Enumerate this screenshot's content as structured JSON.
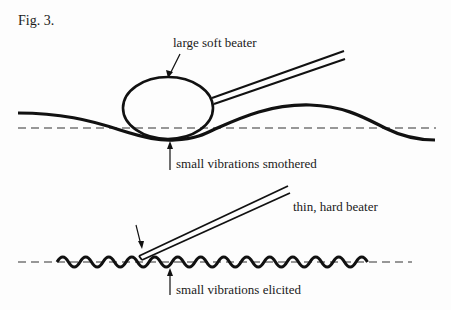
{
  "figure": {
    "label": "Fig. 3.",
    "top_panel": {
      "beater_label": "large soft beater",
      "effect_label": "small vibrations smothered"
    },
    "bottom_panel": {
      "beater_label": "thin, hard beater",
      "effect_label": "small vibrations elicited"
    },
    "colors": {
      "ink": "#1a1a1a",
      "dash": "#333333",
      "background": "#fdfdfd"
    }
  }
}
